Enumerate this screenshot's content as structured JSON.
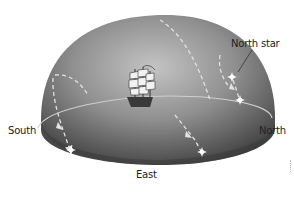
{
  "diagram": {
    "labels": {
      "north_star": "North star",
      "south": "South",
      "north": "North",
      "east": "East"
    },
    "elements": {
      "dome": "dome-shaped sky hemisphere",
      "horizon": "horizon ellipse",
      "ship": "sailing-ship",
      "stars": [
        "north-star",
        "circumpolar-star",
        "east-rising-star",
        "south-star"
      ],
      "paths": [
        "dashed star trail arcs with arrowheads"
      ]
    },
    "colors": {
      "dome_light": "#bdbdbd",
      "dome_dark": "#4a4a4a",
      "dashes": "#d8d8d8",
      "star": "#ffffff",
      "text": "#222222"
    }
  }
}
